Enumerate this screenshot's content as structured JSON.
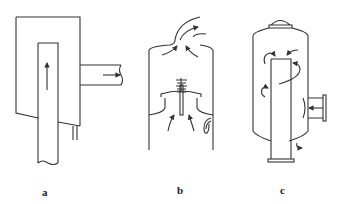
{
  "figure": {
    "panels": [
      {
        "id": "a",
        "label": "a",
        "description": "Vessel with central inlet pipe (flow upward) and side outlet pipe (flow rightward), drain at bottom"
      },
      {
        "id": "b",
        "label": "b",
        "description": "Vessel with baffle cap and spring-loaded valve; flow curving up around the cap to a curved top outlet; U-shaped drain"
      },
      {
        "id": "c",
        "label": "c",
        "description": "Cylindrical vessel with domed top nozzle, central vertical pipe, flanged side inlet with impingement plate, swirling flow arrows, flanged bottom outlet"
      }
    ]
  },
  "colors": {
    "line": "#333333",
    "background": "#ffffff"
  }
}
